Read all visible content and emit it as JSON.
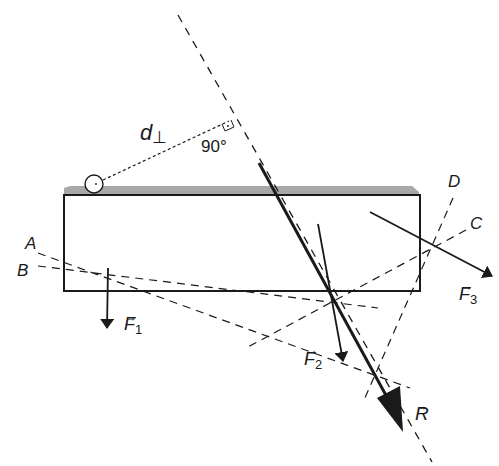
{
  "diagram": {
    "labels": {
      "d_perp": "d",
      "d_perp_sub": "⊥",
      "angle": "90°",
      "line_A": "A",
      "line_B": "B",
      "line_C": "C",
      "line_D": "D",
      "force_1": "F",
      "force_1_sub": "1",
      "force_2": "F",
      "force_2_sub": "2",
      "force_3": "F",
      "force_3_sub": "3",
      "resultant": "R",
      "vector_arrow": "→"
    },
    "colors": {
      "ink": "#1a1a1a",
      "surface_strip": "#a8a8a8",
      "background": "#ffffff"
    }
  }
}
